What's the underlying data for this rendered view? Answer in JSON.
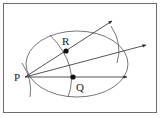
{
  "diagram": {
    "labels": {
      "P": "P",
      "Q": "Q",
      "R": "R"
    },
    "colors": {
      "stroke": "#2a2a2a",
      "arc": "#555555",
      "border": "#6e6e6e",
      "background": "#ffffff"
    },
    "points": {
      "P": [
        25,
        77
      ],
      "R": [
        66,
        51
      ],
      "Q": [
        73,
        77
      ]
    },
    "rays": [
      {
        "from": "P",
        "to": [
          112,
          21
        ],
        "label": "ray-through-R"
      },
      {
        "from": "P",
        "to": [
          146,
          45
        ],
        "label": "ray-middle"
      },
      {
        "from": "P",
        "to": [
          127,
          77
        ],
        "label": "ray-through-Q"
      }
    ]
  }
}
